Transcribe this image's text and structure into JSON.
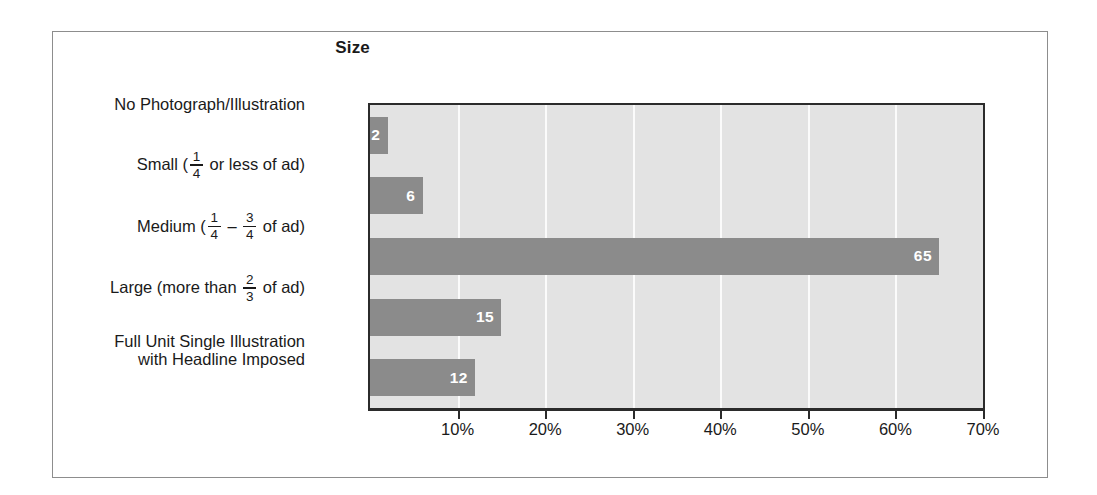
{
  "figure": {
    "title": "Size",
    "frame_color": "#8d8d8d",
    "plot_bg": "#e3e3e3",
    "gridline_color": "#fbfbfb",
    "axis_color": "#2b2b2b"
  },
  "chart_data": {
    "type": "bar",
    "orientation": "horizontal",
    "title": "Size",
    "xlabel": "",
    "ylabel": "",
    "xlim": [
      0,
      70
    ],
    "xtick_values": [
      0,
      10,
      20,
      30,
      40,
      50,
      60,
      70
    ],
    "xtick_labels": [
      "",
      "10%",
      "20%",
      "30%",
      "40%",
      "50%",
      "60%",
      "70%"
    ],
    "grid": true,
    "grid_axis": "x",
    "legend": false,
    "bar_color": "#8b8b8b",
    "value_label_color": "#ffffff",
    "categories": [
      "No Photograph/Illustration",
      "Small (1/4 or less of ad)",
      "Medium (1/4 – 3/4 of ad)",
      "Large (more than 2/3 of ad)",
      "Full Unit Single Illustration with Headline Imposed"
    ],
    "values": [
      2,
      6,
      65,
      15,
      12
    ],
    "value_labels": [
      "2",
      "6",
      "65",
      "15",
      "12"
    ],
    "units": "percent"
  },
  "categories": [
    {
      "id": "no-photograph",
      "value": 2,
      "value_label": "2",
      "lines": [
        {
          "parts": [
            {
              "type": "text",
              "text": "No Photograph/Illustration"
            }
          ]
        }
      ]
    },
    {
      "id": "small",
      "value": 6,
      "value_label": "6",
      "lines": [
        {
          "parts": [
            {
              "type": "text",
              "text": "Small ("
            },
            {
              "type": "fraction",
              "numerator": "1",
              "denominator": "4"
            },
            {
              "type": "text",
              "text": " or less of ad)"
            }
          ]
        }
      ]
    },
    {
      "id": "medium",
      "value": 65,
      "value_label": "65",
      "lines": [
        {
          "parts": [
            {
              "type": "text",
              "text": "Medium ("
            },
            {
              "type": "fraction",
              "numerator": "1",
              "denominator": "4"
            },
            {
              "type": "text",
              "text": " – "
            },
            {
              "type": "fraction",
              "numerator": "3",
              "denominator": "4"
            },
            {
              "type": "text",
              "text": " of ad)"
            }
          ]
        }
      ]
    },
    {
      "id": "large",
      "value": 15,
      "value_label": "15",
      "lines": [
        {
          "parts": [
            {
              "type": "text",
              "text": "Large (more than "
            },
            {
              "type": "fraction",
              "numerator": "2",
              "denominator": "3"
            },
            {
              "type": "text",
              "text": " of ad)"
            }
          ]
        }
      ]
    },
    {
      "id": "full-unit",
      "value": 12,
      "value_label": "12",
      "lines": [
        {
          "parts": [
            {
              "type": "text",
              "text": "Full Unit Single Illustration"
            }
          ]
        },
        {
          "parts": [
            {
              "type": "text",
              "text": "with Headline Imposed"
            }
          ]
        }
      ]
    }
  ]
}
